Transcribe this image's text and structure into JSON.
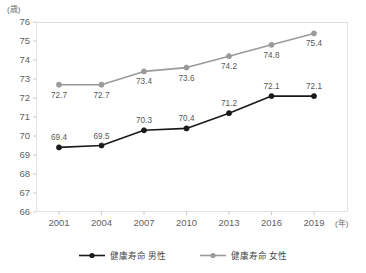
{
  "chart_data": {
    "type": "line",
    "title": "",
    "xlabel": "(年)",
    "ylabel": "(歳)",
    "categories": [
      "2001",
      "2004",
      "2007",
      "2010",
      "2013",
      "2016",
      "2019"
    ],
    "ylim": [
      66,
      76
    ],
    "yticks": [
      "66",
      "67",
      "68",
      "69",
      "70",
      "71",
      "72",
      "73",
      "74",
      "75",
      "76"
    ],
    "grid": false,
    "legend_position": "bottom",
    "series": [
      {
        "name": "健康寿命 男性",
        "color": "#1a1a1a",
        "marker": "circle",
        "label_position": "above",
        "values": [
          69.4,
          69.5,
          70.3,
          70.4,
          71.2,
          72.1,
          72.1
        ],
        "value_labels": [
          "69.4",
          "69.5",
          "70.3",
          "70.4",
          "71.2",
          "72.1",
          "72.1"
        ]
      },
      {
        "name": "健康寿命 女性",
        "color": "#9a9a9a",
        "marker": "circle",
        "label_position": "below",
        "values": [
          72.7,
          72.7,
          73.4,
          73.6,
          74.2,
          74.8,
          75.4
        ],
        "value_labels": [
          "72.7",
          "72.7",
          "73.4",
          "73.6",
          "74.2",
          "74.8",
          "75.4"
        ]
      }
    ]
  },
  "axis": {
    "y_unit": "(歳)",
    "x_unit": "(年)"
  },
  "legend": {
    "items": [
      {
        "label": "健康寿命 男性"
      },
      {
        "label": "健康寿命 女性"
      }
    ]
  }
}
